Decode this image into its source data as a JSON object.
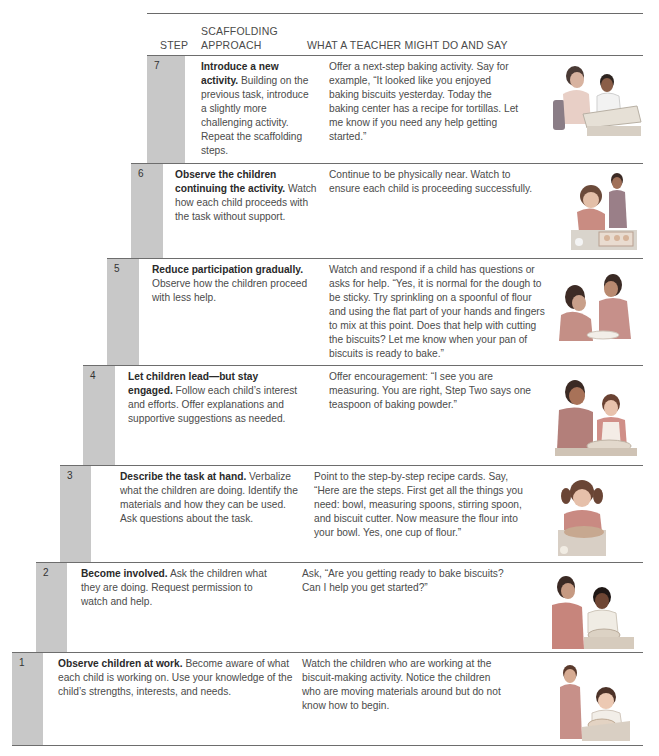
{
  "table": {
    "headers": {
      "step": "STEP",
      "approach": "SCAFFOLDING APPROACH",
      "teacher": "WHAT A TEACHER MIGHT DO AND SAY"
    },
    "rows": [
      {
        "step": "7",
        "approach_title": "Introduce a new activity.",
        "approach_body": " Building on the previous task, introduce a slightly more challenging activity. Repeat the scaffolding steps.",
        "teacher": "Offer a next-step baking activity. Say for example, “It looked like you enjoyed baking biscuits yesterday. Today the baking center has a recipe for tortillas. Let me know if you need any help getting started.”",
        "image": "teacher-and-child-at-table-illustration"
      },
      {
        "step": "6",
        "approach_title": "Observe the children continuing the activity.",
        "approach_body": " Watch how each child proceeds with the task without support.",
        "teacher": "Continue to be physically near. Watch to ensure each child is proceeding successfully.",
        "image": "child-cutting-biscuits-teacher-watching-illustration"
      },
      {
        "step": "5",
        "approach_title": "Reduce participation gradually.",
        "approach_body": " Observe how the children proceed with less help.",
        "teacher": "Watch and respond if a child has questions or asks for help. “Yes, it is normal for the dough to be sticky. Try sprinkling on a spoonful of flour and using the flat part of your hands and fingers to mix at this point. Does that help with cutting the biscuits? Let me know when your pan of biscuits is ready to bake.”",
        "image": "teacher-helping-child-with-dough-illustration"
      },
      {
        "step": "4",
        "approach_title": "Let children lead—but stay engaged.",
        "approach_body": " Follow each child’s interest and efforts. Offer explanations and supportive suggestions as needed.",
        "teacher": "Offer encouragement: “I see you are measuring. You are right, Step Two says one teaspoon of baking powder.”",
        "image": "teacher-and-child-measuring-illustration"
      },
      {
        "step": "3",
        "approach_title": "Describe the task at hand.",
        "approach_body": " Verbalize what the children are doing. Identify the materials and how they can be used. Ask questions about the task.",
        "teacher": "Point to the step-by-step recipe cards. Say, “Here are the steps. First get all the things you need: bowl, measuring spoons, stirring spoon, and biscuit cutter. Now measure the flour into your bowl. Yes, one cup of flour.”",
        "image": "child-measuring-flour-illustration"
      },
      {
        "step": "2",
        "approach_title": "Become involved.",
        "approach_body": " Ask the children what they are doing. Request permission to watch and help.",
        "teacher": "Ask, “Are you getting ready to bake biscuits? Can I help you get started?”",
        "image": "teacher-talking-with-child-illustration"
      },
      {
        "step": "1",
        "approach_title": "Observe children at work.",
        "approach_body": " Become aware of what each child is working on. Use your knowledge of the child’s strengths, interests, and needs.",
        "teacher": "Watch the children who are working at the biscuit-making activity. Notice the children who are moving materials around but do not know how to begin.",
        "image": "teacher-observing-child-illustration"
      }
    ]
  },
  "colors": {
    "step_bar": "#c8c8c8",
    "rule": "#6d6d6d",
    "text": "#4b4b4b",
    "bold_text": "#2a2a2a"
  }
}
